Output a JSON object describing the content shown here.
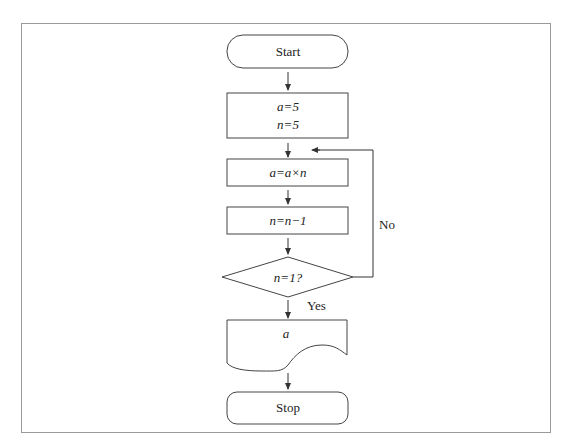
{
  "diagram": {
    "type": "flowchart",
    "nodes": {
      "start": {
        "shape": "terminator",
        "label": "Start"
      },
      "init": {
        "shape": "process",
        "lines": [
          "a=5",
          "n=5"
        ]
      },
      "multiply": {
        "shape": "process",
        "label": "a=a×n"
      },
      "decrement": {
        "shape": "process",
        "label": "n=n−1"
      },
      "decision": {
        "shape": "decision",
        "label": "n=1?"
      },
      "output": {
        "shape": "document",
        "label": "a"
      },
      "stop": {
        "shape": "terminator",
        "label": "Stop"
      }
    },
    "edges": [
      {
        "from": "start",
        "to": "init",
        "label": ""
      },
      {
        "from": "init",
        "to": "multiply",
        "label": ""
      },
      {
        "from": "multiply",
        "to": "decrement",
        "label": ""
      },
      {
        "from": "decrement",
        "to": "decision",
        "label": ""
      },
      {
        "from": "decision",
        "to": "output",
        "label": "Yes"
      },
      {
        "from": "decision",
        "to": "multiply",
        "label": "No"
      },
      {
        "from": "output",
        "to": "stop",
        "label": ""
      }
    ],
    "edge_labels": {
      "yes": "Yes",
      "no": "No"
    }
  }
}
